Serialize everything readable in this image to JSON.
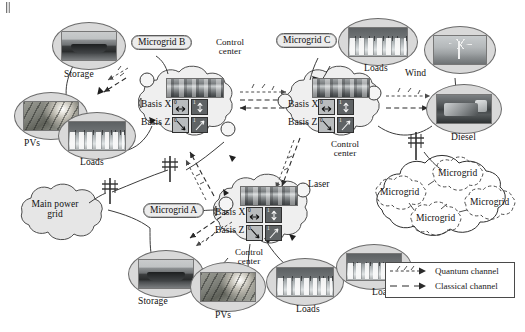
{
  "figure": {
    "background_color": "#ffffff",
    "line_color": "#3a3a3a",
    "cloud_fill": "#ececec",
    "width": 525,
    "height": 332
  },
  "microgrids": [
    {
      "id": "b",
      "name_label": "Microgrid B",
      "control_center_label": "Control center",
      "basis_x_label": "Basis X",
      "basis_z_label": "Basis Z",
      "basis_states": [
        {
          "basis": "X",
          "bit": "0",
          "polarization": "horizontal",
          "glyph": "left-right-arrow"
        },
        {
          "basis": "X",
          "bit": "1",
          "polarization": "vertical",
          "glyph": "up-down-arrow"
        },
        {
          "basis": "Z",
          "bit": "0",
          "polarization": "anti-diagonal",
          "glyph": "diagonal-down-arrow"
        },
        {
          "basis": "Z",
          "bit": "1",
          "polarization": "diagonal",
          "glyph": "diagonal-up-arrow"
        }
      ],
      "assets": [
        {
          "name": "Storage",
          "image": "battery-storage-photo"
        },
        {
          "name": "PVs",
          "image": "solar-panel-photo"
        },
        {
          "name": "Loads",
          "image": "houses-photo"
        }
      ]
    },
    {
      "id": "c",
      "name_label": "Microgrid C",
      "control_center_label": "Control center",
      "basis_x_label": "Basis X",
      "basis_z_label": "Basis Z",
      "basis_states": [
        {
          "basis": "X",
          "bit": "0",
          "polarization": "horizontal",
          "glyph": "left-right-arrow"
        },
        {
          "basis": "X",
          "bit": "1",
          "polarization": "vertical",
          "glyph": "up-down-arrow"
        },
        {
          "basis": "Z",
          "bit": "0",
          "polarization": "anti-diagonal",
          "glyph": "diagonal-down-arrow"
        },
        {
          "basis": "Z",
          "bit": "1",
          "polarization": "diagonal",
          "glyph": "diagonal-up-arrow"
        }
      ],
      "assets": [
        {
          "name": "Loads",
          "image": "houses-photo"
        },
        {
          "name": "Wind",
          "image": "wind-turbine-photo"
        },
        {
          "name": "Diesel",
          "image": "diesel-generator-photo"
        }
      ]
    },
    {
      "id": "a",
      "name_label": "Microgrid A",
      "control_center_label": "Control center",
      "basis_x_label": "Basis X",
      "basis_z_label": "Basis Z",
      "laser_label": "Laser",
      "basis_states": [
        {
          "basis": "X",
          "bit": "0",
          "polarization": "horizontal",
          "glyph": "left-right-arrow"
        },
        {
          "basis": "X",
          "bit": "1",
          "polarization": "vertical",
          "glyph": "up-down-arrow"
        },
        {
          "basis": "Z",
          "bit": "0",
          "polarization": "anti-diagonal",
          "glyph": "diagonal-down-arrow"
        },
        {
          "basis": "Z",
          "bit": "1",
          "polarization": "diagonal",
          "glyph": "diagonal-up-arrow"
        }
      ],
      "assets": [
        {
          "name": "Storage",
          "image": "battery-storage-photo"
        },
        {
          "name": "PVs",
          "image": "solar-panel-photo"
        },
        {
          "name": "Loads",
          "image": "houses-photo"
        },
        {
          "name": "Loads",
          "image": "houses-photo"
        }
      ]
    }
  ],
  "main_grid": {
    "label": "Main power grid"
  },
  "other_microgrids_cloud": {
    "items": [
      "Microgrid",
      "Microgrid",
      "Microgrid",
      "Microgrid"
    ]
  },
  "legend": {
    "items": [
      {
        "label": "Quantum channel",
        "style": "dashed-with-polarization-marks"
      },
      {
        "label": "Classical channel",
        "style": "dashed-arrow"
      }
    ]
  },
  "icons": {
    "transmission_tower": "pylon-icon",
    "quantum_node": "circle-node-icon"
  }
}
